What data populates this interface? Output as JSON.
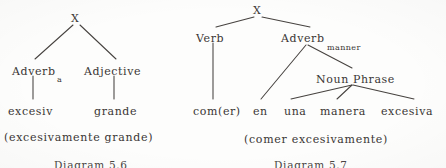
{
  "page": {
    "width": 446,
    "height": 168,
    "background_color": "#fdfdfc",
    "ink_color": "#3a3634"
  },
  "diagrams": [
    {
      "id": "diagram-5-6",
      "figure_number": "Diagram 5.6",
      "gloss": "(excesivamente grande)",
      "root": {
        "label": "X",
        "x": 74,
        "y": 13
      },
      "nodes": [
        {
          "name": "root",
          "label": "X",
          "x": 74,
          "y": 13,
          "size": "root"
        },
        {
          "name": "adverb",
          "label": "Adverb",
          "x": 12,
          "y": 66,
          "size": "normal"
        },
        {
          "name": "adverb-sub",
          "label": "a",
          "x": 57,
          "y": 76,
          "size": "sub"
        },
        {
          "name": "adjective",
          "label": "Adjective",
          "x": 84,
          "y": 66,
          "size": "normal"
        },
        {
          "name": "terminal-1",
          "label": "excesiv",
          "x": 8,
          "y": 106,
          "size": "normal"
        },
        {
          "name": "terminal-2",
          "label": "grande",
          "x": 94,
          "y": 106,
          "size": "normal"
        }
      ],
      "edges": [
        {
          "from": "root",
          "to": "adverb",
          "x1": 73,
          "y1": 25,
          "x2": 35,
          "y2": 59
        },
        {
          "from": "root",
          "to": "adjective",
          "x1": 80,
          "y1": 25,
          "x2": 116,
          "y2": 59
        },
        {
          "from": "adverb",
          "to": "terminal-1",
          "x1": 33,
          "y1": 76,
          "x2": 33,
          "y2": 99
        },
        {
          "from": "adjective",
          "to": "terminal-2",
          "x1": 114,
          "y1": 76,
          "x2": 114,
          "y2": 99
        }
      ]
    },
    {
      "id": "diagram-5-7",
      "figure_number": "Diagram 5.7",
      "gloss": "(comer excesivamente)",
      "root": {
        "label": "X",
        "x": 256,
        "y": 5
      },
      "nodes": [
        {
          "name": "root",
          "label": "X",
          "x": 256,
          "y": 5,
          "size": "root"
        },
        {
          "name": "verb",
          "label": "Verb",
          "x": 196,
          "y": 33,
          "size": "normal"
        },
        {
          "name": "adverb",
          "label": "Adverb",
          "x": 281,
          "y": 33,
          "size": "normal"
        },
        {
          "name": "adverb-sub",
          "label": "manner",
          "x": 327,
          "y": 44,
          "size": "sub"
        },
        {
          "name": "noun-phrase",
          "label": "Noun Phrase",
          "x": 316,
          "y": 74,
          "size": "normal"
        },
        {
          "name": "terminal-verb",
          "label": "com(er)",
          "x": 193,
          "y": 106,
          "size": "normal"
        },
        {
          "name": "terminal-en",
          "label": "en",
          "x": 253,
          "y": 106,
          "size": "normal"
        },
        {
          "name": "terminal-una",
          "label": "una",
          "x": 284,
          "y": 106,
          "size": "normal"
        },
        {
          "name": "terminal-manera",
          "label": "manera",
          "x": 320,
          "y": 106,
          "size": "normal"
        },
        {
          "name": "terminal-excesiva",
          "label": "excesiva",
          "x": 381,
          "y": 106,
          "size": "normal"
        }
      ],
      "edges": [
        {
          "from": "root",
          "to": "verb",
          "x1": 254,
          "y1": 17,
          "x2": 216,
          "y2": 27
        },
        {
          "from": "root",
          "to": "adverb",
          "x1": 262,
          "y1": 17,
          "x2": 310,
          "y2": 27
        },
        {
          "from": "verb",
          "to": "terminal-verb",
          "x1": 213,
          "y1": 43,
          "x2": 213,
          "y2": 99
        },
        {
          "from": "adverb",
          "to": "terminal-en",
          "x1": 306,
          "y1": 44,
          "x2": 261,
          "y2": 99
        },
        {
          "from": "adverb",
          "to": "noun-phrase",
          "x1": 308,
          "y1": 44,
          "x2": 352,
          "y2": 68
        },
        {
          "from": "noun-phrase",
          "to": "terminal-una",
          "x1": 352,
          "y1": 85,
          "x2": 291,
          "y2": 99
        },
        {
          "from": "noun-phrase",
          "to": "terminal-manera",
          "x1": 352,
          "y1": 85,
          "x2": 337,
          "y2": 99
        },
        {
          "from": "noun-phrase",
          "to": "terminal-excesiva",
          "x1": 353,
          "y1": 85,
          "x2": 414,
          "y2": 99
        }
      ]
    }
  ],
  "captions": {
    "left_gloss": "(excesivamente grande)",
    "left_gloss_x": 4,
    "left_gloss_y": 132,
    "right_gloss": "(comer excesivamente)",
    "right_gloss_x": 244,
    "right_gloss_y": 134,
    "left_figure": "Diagram 5.6",
    "left_figure_x": 54,
    "left_figure_y": 160,
    "right_figure": "Diagram 5.7",
    "right_figure_x": 274,
    "right_figure_y": 160
  }
}
